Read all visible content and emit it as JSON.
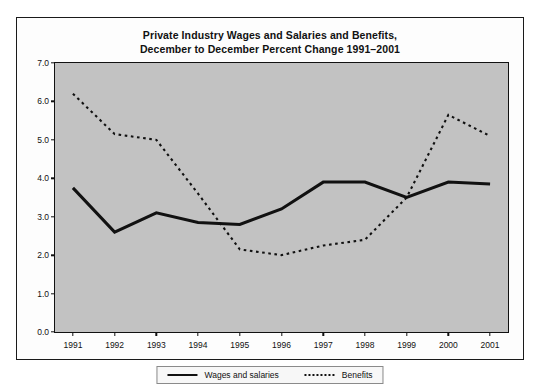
{
  "chart_data": {
    "type": "line",
    "title": "Private Industry Wages and Salaries and Benefits, December to December Percent Change 1991–2001",
    "title_line1": "Private Industry Wages and Salaries and Benefits,",
    "title_line2": "December to December Percent Change 1991–2001",
    "xlabel": "",
    "ylabel": "",
    "categories": [
      "1991",
      "1992",
      "1993",
      "1994",
      "1995",
      "1996",
      "1997",
      "1998",
      "1999",
      "2000",
      "2001"
    ],
    "x": [
      1991,
      1992,
      1993,
      1994,
      1995,
      1996,
      1997,
      1998,
      1999,
      2000,
      2001
    ],
    "series": [
      {
        "name": "Wages and salaries",
        "style": "solid",
        "color": "#111111",
        "values": [
          3.75,
          2.6,
          3.1,
          2.85,
          2.8,
          3.2,
          3.9,
          3.9,
          3.5,
          3.9,
          3.85
        ]
      },
      {
        "name": "Benefits",
        "style": "dotted",
        "color": "#111111",
        "values": [
          6.2,
          5.15,
          5.0,
          3.6,
          2.15,
          2.0,
          2.25,
          2.4,
          3.5,
          5.65,
          5.1
        ]
      }
    ],
    "ylim": [
      0.0,
      7.0
    ],
    "ytick_labels": [
      "0.0",
      "1.0",
      "2.0",
      "3.0",
      "4.0",
      "5.0",
      "6.0",
      "7.0"
    ],
    "ytick_values": [
      0.0,
      1.0,
      2.0,
      3.0,
      4.0,
      5.0,
      6.0,
      7.0
    ],
    "grid": false,
    "legend_position": "bottom-center",
    "plot_background": "#c2c2c2",
    "figure_background": "#fdfdfd"
  },
  "legend": {
    "entries": [
      {
        "label": "Wages and salaries",
        "style": "solid"
      },
      {
        "label": "Benefits",
        "style": "dotted"
      }
    ]
  }
}
